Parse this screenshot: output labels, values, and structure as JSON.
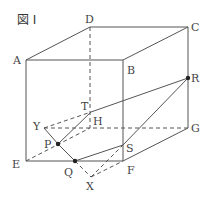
{
  "figure": {
    "title": "図 I",
    "stroke_color": "#555555",
    "points": {
      "A": {
        "label": "A",
        "x": 26,
        "y": 60
      },
      "B": {
        "label": "B",
        "x": 123,
        "y": 60
      },
      "C": {
        "label": "C",
        "x": 188,
        "y": 27
      },
      "D": {
        "label": "D",
        "x": 90,
        "y": 27
      },
      "E": {
        "label": "E",
        "x": 26,
        "y": 161
      },
      "F": {
        "label": "F",
        "x": 123,
        "y": 161
      },
      "G": {
        "label": "G",
        "x": 188,
        "y": 128
      },
      "H": {
        "label": "H",
        "x": 90,
        "y": 128
      },
      "R": {
        "label": "R",
        "x": 188,
        "y": 78
      },
      "T": {
        "label": "T",
        "x": 91,
        "y": 112
      },
      "Y": {
        "label": "Y",
        "x": 44,
        "y": 128
      },
      "P": {
        "label": "P",
        "x": 58,
        "y": 144
      },
      "Q": {
        "label": "Q",
        "x": 75,
        "y": 161
      },
      "X": {
        "label": "X",
        "x": 91,
        "y": 177
      },
      "S": {
        "label": "S",
        "x": 123,
        "y": 145
      }
    },
    "labels": {
      "A": "A",
      "B": "B",
      "C": "C",
      "D": "D",
      "E": "E",
      "F": "F",
      "G": "G",
      "H": "H",
      "R": "R",
      "T": "T",
      "Y": "Y",
      "P": "P",
      "Q": "Q",
      "X": "X",
      "S": "S"
    }
  }
}
